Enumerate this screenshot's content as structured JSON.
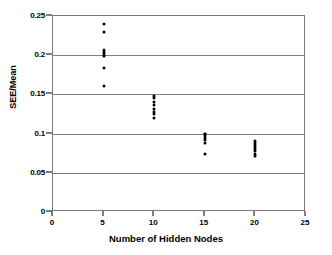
{
  "chart_data": {
    "type": "scatter",
    "title": "",
    "xlabel": "Number of Hidden Nodes",
    "ylabel": "SEE/Mean",
    "xlim": [
      0,
      25
    ],
    "ylim": [
      0,
      0.25
    ],
    "xticks": [
      0,
      5,
      10,
      15,
      20,
      25
    ],
    "xtick_labels": [
      "0",
      "5",
      "10",
      "15",
      "20",
      "25"
    ],
    "yticks": [
      0,
      0.05,
      0.1,
      0.15,
      0.2,
      0.25
    ],
    "ytick_labels": [
      "0",
      "0.05",
      "0.1",
      "0.15",
      "0.2",
      "0.25"
    ],
    "grid": "horizontal",
    "legend": "none",
    "marker": "filled-circle",
    "marker_color": "#000000",
    "series": [
      {
        "name": "SEE/Mean vs Hidden Nodes",
        "points": [
          {
            "x": 5,
            "y": 0.24
          },
          {
            "x": 5,
            "y": 0.229
          },
          {
            "x": 5,
            "y": 0.206
          },
          {
            "x": 5,
            "y": 0.2035
          },
          {
            "x": 5,
            "y": 0.201
          },
          {
            "x": 5,
            "y": 0.199
          },
          {
            "x": 5,
            "y": 0.184
          },
          {
            "x": 5,
            "y": 0.1605
          },
          {
            "x": 10,
            "y": 0.148
          },
          {
            "x": 10,
            "y": 0.146
          },
          {
            "x": 10,
            "y": 0.14
          },
          {
            "x": 10,
            "y": 0.136
          },
          {
            "x": 10,
            "y": 0.131
          },
          {
            "x": 10,
            "y": 0.1275
          },
          {
            "x": 10,
            "y": 0.125
          },
          {
            "x": 10,
            "y": 0.12
          },
          {
            "x": 15,
            "y": 0.1
          },
          {
            "x": 15,
            "y": 0.099
          },
          {
            "x": 15,
            "y": 0.0965
          },
          {
            "x": 15,
            "y": 0.094
          },
          {
            "x": 15,
            "y": 0.0915
          },
          {
            "x": 15,
            "y": 0.0885
          },
          {
            "x": 15,
            "y": 0.0745
          },
          {
            "x": 20,
            "y": 0.09
          },
          {
            "x": 20,
            "y": 0.0885
          },
          {
            "x": 20,
            "y": 0.086
          },
          {
            "x": 20,
            "y": 0.083
          },
          {
            "x": 20,
            "y": 0.08
          },
          {
            "x": 20,
            "y": 0.0775
          },
          {
            "x": 20,
            "y": 0.0745
          },
          {
            "x": 20,
            "y": 0.072
          }
        ]
      }
    ]
  }
}
